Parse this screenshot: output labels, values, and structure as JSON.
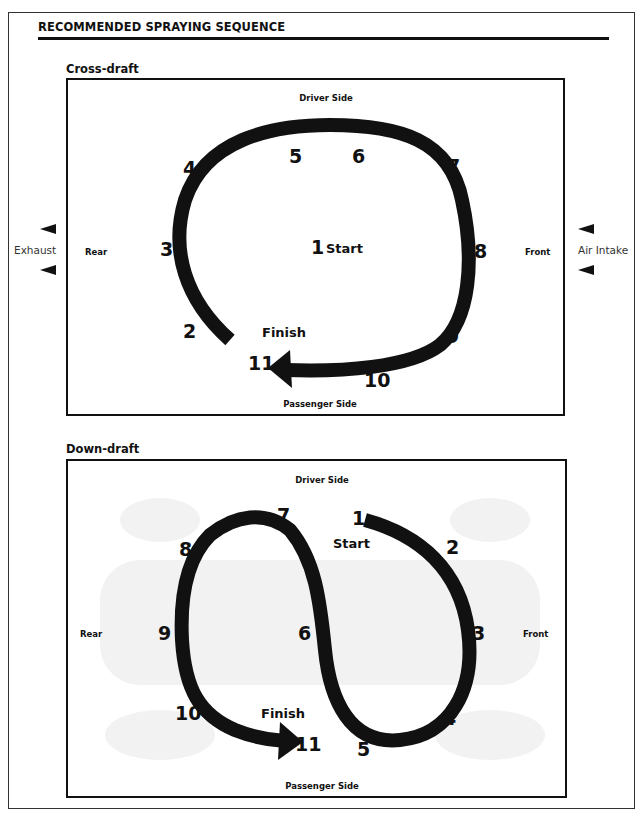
{
  "title": "RECOMMENDED SPRAYING SEQUENCE",
  "cross_draft": {
    "title": "Cross-draft",
    "top_label": "Driver Side",
    "bottom_label": "Passenger Side",
    "left_label": "Rear",
    "right_label": "Front",
    "outside_left": "Exhaust",
    "outside_right": "Air Intake",
    "start_label": "Start",
    "finish_label": "Finish",
    "sequence": [
      "1",
      "2",
      "3",
      "4",
      "5",
      "6",
      "7",
      "8",
      "9",
      "10",
      "11"
    ]
  },
  "down_draft": {
    "title": "Down-draft",
    "top_label": "Driver Side",
    "bottom_label": "Passenger Side",
    "left_label": "Rear",
    "right_label": "Front",
    "start_label": "Start",
    "finish_label": "Finish",
    "sequence": [
      "1",
      "2",
      "3",
      "4",
      "5",
      "6",
      "7",
      "8",
      "9",
      "10",
      "11"
    ]
  },
  "colors": {
    "ink": "#111111",
    "background": "#ffffff",
    "ghost_car": "#f1f1f1"
  }
}
